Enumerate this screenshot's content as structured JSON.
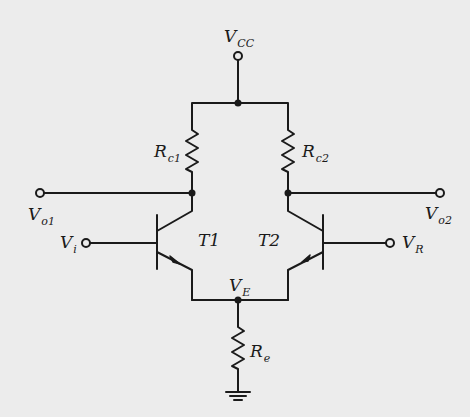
{
  "diagram": {
    "type": "circuit-schematic",
    "title": "",
    "colors": {
      "background": "#ececec",
      "ink": "#1a1a1a"
    },
    "labels": {
      "vcc": {
        "main": "V",
        "sub": "CC"
      },
      "rc1": {
        "main": "R",
        "sub": "c1"
      },
      "rc2": {
        "main": "R",
        "sub": "c2"
      },
      "vo1": {
        "main": "V",
        "sub": "o1"
      },
      "vo2": {
        "main": "V",
        "sub": "o2"
      },
      "vi": {
        "main": "V",
        "sub": "i"
      },
      "vr": {
        "main": "V",
        "sub": "R"
      },
      "ve": {
        "main": "V",
        "sub": "E"
      },
      "re": {
        "main": "R",
        "sub": "e"
      },
      "t1": "T1",
      "t2": "T2"
    },
    "components": [
      {
        "id": "T1",
        "kind": "npn-transistor"
      },
      {
        "id": "T2",
        "kind": "npn-transistor"
      },
      {
        "id": "Rc1",
        "kind": "resistor"
      },
      {
        "id": "Rc2",
        "kind": "resistor"
      },
      {
        "id": "Re",
        "kind": "resistor"
      },
      {
        "id": "GND",
        "kind": "ground"
      }
    ],
    "terminals": [
      "VCC",
      "Vo1",
      "Vo2",
      "Vi",
      "VR"
    ],
    "nodes": [
      "VCC-junction",
      "T1-collector",
      "T2-collector",
      "VE"
    ]
  }
}
